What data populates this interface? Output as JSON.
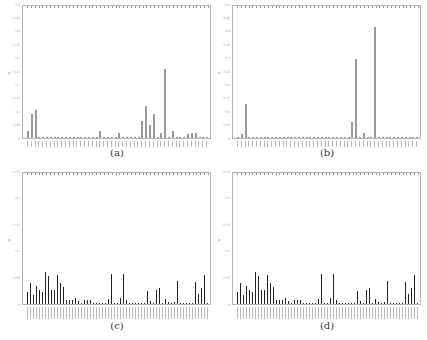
{
  "captions": [
    "(a)",
    "(b)",
    "(c)",
    "(d)"
  ],
  "chart_data": [
    {
      "type": "bar",
      "title": "",
      "caption": "(a)",
      "xlabel": "",
      "ylabel": "p",
      "ylim": [
        0,
        0.5
      ],
      "yticks": [
        "0",
        "0.05",
        "0.1",
        "0.15",
        "0.2",
        "0.25",
        "0.3",
        "0.35",
        "0.4",
        "0.45",
        "0.5"
      ],
      "style": "light",
      "values": [
        0.025,
        0.09,
        0.105,
        0.002,
        0.002,
        0.002,
        0.002,
        0.002,
        0.004,
        0.002,
        0.002,
        0.002,
        0.002,
        0.002,
        0.002,
        0.002,
        0.002,
        0.002,
        0.002,
        0.025,
        0.004,
        0.002,
        0.002,
        0.002,
        0.018,
        0.004,
        0.002,
        0.002,
        0.002,
        0.004,
        0.065,
        0.12,
        0.05,
        0.09,
        0.004,
        0.018,
        0.26,
        0.002,
        0.025,
        0.004,
        0.002,
        0.002,
        0.015,
        0.02,
        0.02,
        0.004,
        0.004,
        0.004
      ]
    },
    {
      "type": "bar",
      "title": "",
      "caption": "(b)",
      "xlabel": "",
      "ylabel": "p",
      "ylim": [
        0,
        0.5
      ],
      "yticks": [
        "0",
        "0.05",
        "0.1",
        "0.15",
        "0.2",
        "0.25",
        "0.3",
        "0.35",
        "0.4",
        "0.45",
        "0.5"
      ],
      "style": "light",
      "values": [
        0.002,
        0.015,
        0.13,
        0.002,
        0.002,
        0.002,
        0.002,
        0.002,
        0.002,
        0.002,
        0.002,
        0.002,
        0.002,
        0.002,
        0.002,
        0.002,
        0.002,
        0.002,
        0.002,
        0.002,
        0.002,
        0.002,
        0.002,
        0.002,
        0.002,
        0.002,
        0.002,
        0.002,
        0.002,
        0.002,
        0.06,
        0.3,
        0.002,
        0.02,
        0.002,
        0.002,
        0.42,
        0.002,
        0.002,
        0.002,
        0.002,
        0.002,
        0.002,
        0.002,
        0.002,
        0.002,
        0.002,
        0.002
      ]
    },
    {
      "type": "bar",
      "title": "",
      "caption": "(c)",
      "xlabel": "",
      "ylabel": "p",
      "ylim": [
        0,
        0.25
      ],
      "yticks": [
        "0",
        "0.05",
        "0.1",
        "0.15",
        "0.2",
        "0.25"
      ],
      "style": "dark",
      "values": [
        0.022,
        0.04,
        0.018,
        0.035,
        0.026,
        0.022,
        0.062,
        0.053,
        0.027,
        0.027,
        0.055,
        0.04,
        0.032,
        0.008,
        0.007,
        0.007,
        0.012,
        0.005,
        0.002,
        0.008,
        0.008,
        0.008,
        0.002,
        0.002,
        0.002,
        0.002,
        0.002,
        0.01,
        0.057,
        0.002,
        0.002,
        0.012,
        0.058,
        0.008,
        0.002,
        0.002,
        0.002,
        0.002,
        0.002,
        0.002,
        0.024,
        0.006,
        0.002,
        0.026,
        0.031,
        0.002,
        0.01,
        0.004,
        0.002,
        0.003,
        0.043,
        0.002,
        0.002,
        0.002,
        0.002,
        0.002,
        0.042,
        0.02,
        0.03,
        0.055,
        0.002
      ]
    },
    {
      "type": "bar",
      "title": "",
      "caption": "(d)",
      "xlabel": "",
      "ylabel": "p",
      "ylim": [
        0,
        0.25
      ],
      "yticks": [
        "0",
        "0.05",
        "0.1",
        "0.15",
        "0.2",
        "0.25"
      ],
      "style": "dark",
      "values": [
        0.022,
        0.04,
        0.018,
        0.035,
        0.026,
        0.022,
        0.062,
        0.053,
        0.027,
        0.027,
        0.055,
        0.04,
        0.032,
        0.008,
        0.007,
        0.007,
        0.012,
        0.005,
        0.002,
        0.008,
        0.008,
        0.008,
        0.002,
        0.002,
        0.002,
        0.002,
        0.002,
        0.01,
        0.057,
        0.002,
        0.002,
        0.012,
        0.058,
        0.008,
        0.002,
        0.002,
        0.002,
        0.002,
        0.002,
        0.002,
        0.024,
        0.006,
        0.002,
        0.026,
        0.031,
        0.002,
        0.01,
        0.004,
        0.002,
        0.003,
        0.043,
        0.002,
        0.002,
        0.002,
        0.002,
        0.002,
        0.042,
        0.02,
        0.03,
        0.055,
        0.002
      ]
    }
  ]
}
